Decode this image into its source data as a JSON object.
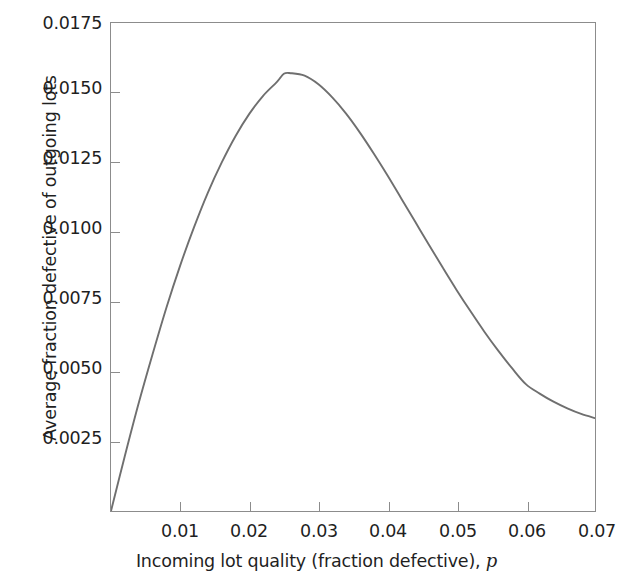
{
  "chart_data": {
    "type": "line",
    "title": "",
    "subtitle": "",
    "xlabel_plain": "Incoming lot quality (fraction defective), ",
    "xlabel_italic": "p",
    "ylabel": "Average fraction defective of outgoing lots",
    "xlim": [
      0.0,
      0.07
    ],
    "ylim": [
      0.0,
      0.0175
    ],
    "grid": false,
    "legend": null,
    "line_color": "#6f6f6f",
    "axis_color": "#8c8c8c",
    "background": "#ffffff",
    "xticks": [
      0.01,
      0.02,
      0.03,
      0.04,
      0.05,
      0.06,
      0.07
    ],
    "xtick_labels": [
      "0.01",
      "0.02",
      "0.03",
      "0.04",
      "0.05",
      "0.06",
      "0.07"
    ],
    "yticks": [
      0.0025,
      0.005,
      0.0075,
      0.01,
      0.0125,
      0.015,
      0.0175
    ],
    "ytick_labels": [
      "0.0025",
      "0.0050",
      "0.0075",
      "0.0100",
      "0.0125",
      "0.0150",
      "0.0175"
    ],
    "x": [
      0.0,
      0.002,
      0.004,
      0.006,
      0.008,
      0.01,
      0.012,
      0.014,
      0.016,
      0.018,
      0.02,
      0.022,
      0.024,
      0.025,
      0.026,
      0.028,
      0.03,
      0.032,
      0.034,
      0.036,
      0.038,
      0.04,
      0.042,
      0.044,
      0.046,
      0.048,
      0.05,
      0.052,
      0.054,
      0.056,
      0.058,
      0.06,
      0.062,
      0.064,
      0.066,
      0.068,
      0.07
    ],
    "y": [
      0.0,
      0.00197,
      0.00386,
      0.00561,
      0.00728,
      0.0088,
      0.01017,
      0.01141,
      0.01249,
      0.01344,
      0.01424,
      0.01489,
      0.01539,
      0.01568,
      0.0157,
      0.01561,
      0.0153,
      0.01483,
      0.01425,
      0.01357,
      0.01282,
      0.01203,
      0.0112,
      0.01037,
      0.00954,
      0.00872,
      0.00792,
      0.00716,
      0.00643,
      0.00575,
      0.00512,
      0.00455,
      0.00421,
      0.00392,
      0.00368,
      0.00348,
      0.00333
    ],
    "annotations": {
      "peak_x": 0.0255,
      "peak_y": 0.0157,
      "end_x": 0.07,
      "end_y": 0.0033,
      "start_x": 0.0,
      "start_y": 0.0
    },
    "series": [
      {
        "name": "AOQ curve",
        "color": "#6f6f6f"
      }
    ]
  },
  "figure": {
    "caption_fragment": ""
  }
}
